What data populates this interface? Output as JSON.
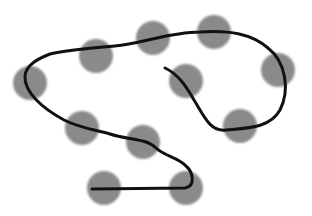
{
  "diagram": {
    "background": "#ffffff",
    "circle_color": "#8a8a8a",
    "stroke_color": "#111111",
    "circle_radius": 17,
    "circles": [
      {
        "cx": 96,
        "cy": 56
      },
      {
        "cx": 153,
        "cy": 38
      },
      {
        "cx": 214,
        "cy": 32
      },
      {
        "cx": 30,
        "cy": 83
      },
      {
        "cx": 186,
        "cy": 81
      },
      {
        "cx": 278,
        "cy": 70
      },
      {
        "cx": 82,
        "cy": 128
      },
      {
        "cx": 143,
        "cy": 142
      },
      {
        "cx": 240,
        "cy": 126
      },
      {
        "cx": 104,
        "cy": 188
      },
      {
        "cx": 186,
        "cy": 188
      }
    ],
    "path": "M 92 189 L 185 188 C 196 186 193 172 186 166 C 178 157 164 156 156 148 C 146 138 128 140 110 134 C 96 130 80 128 64 120 C 42 108 24 92 25 76 C 26 64 40 58 50 54 C 66 50 90 48 115 46 C 140 44 170 32 200 32 C 230 30 252 34 268 48 C 286 62 290 90 280 110 C 270 128 248 128 226 130 C 210 132 204 116 194 100 C 186 86 178 74 165 68"
  }
}
